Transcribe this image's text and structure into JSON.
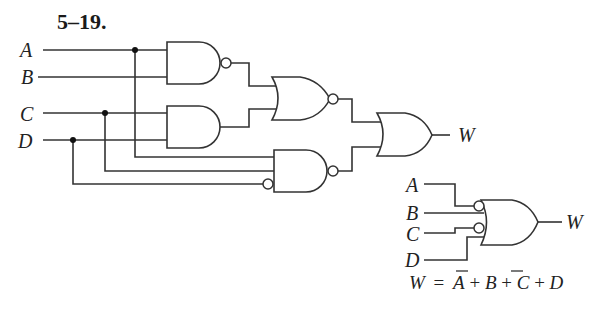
{
  "problem": {
    "number": "5–19."
  },
  "inputs": [
    {
      "name": "A"
    },
    {
      "name": "B"
    },
    {
      "name": "C"
    },
    {
      "name": "D"
    }
  ],
  "output": {
    "name": "W"
  },
  "gates": [
    {
      "id": "g1",
      "type": "NAND",
      "inputs": [
        "A",
        "B"
      ]
    },
    {
      "id": "g2",
      "type": "AND",
      "inputs": [
        "C",
        "D"
      ]
    },
    {
      "id": "g3",
      "type": "NOR",
      "inputs": [
        "g1",
        "g2"
      ]
    },
    {
      "id": "g4",
      "type": "NAND",
      "inputs": [
        "A",
        "C",
        "D'"
      ],
      "inverted_inputs": [
        "D"
      ]
    },
    {
      "id": "g5",
      "type": "OR",
      "inputs": [
        "g3",
        "g4"
      ],
      "output": "W"
    }
  ],
  "simplified": {
    "inputs": [
      "A",
      "B",
      "C",
      "D"
    ],
    "inverted_inputs": [
      "A",
      "C"
    ],
    "output": "W",
    "equation": {
      "lhs": "W",
      "equals": "=",
      "terms": [
        {
          "var": "A",
          "bar": true
        },
        {
          "op": "+"
        },
        {
          "var": "B",
          "bar": false
        },
        {
          "op": "+"
        },
        {
          "var": "C",
          "bar": true
        },
        {
          "op": "+"
        },
        {
          "var": "D",
          "bar": false
        }
      ],
      "text": "W = A̅+B+C̅+D"
    }
  },
  "colors": {
    "line": "#333333",
    "background": "#ffffff"
  }
}
